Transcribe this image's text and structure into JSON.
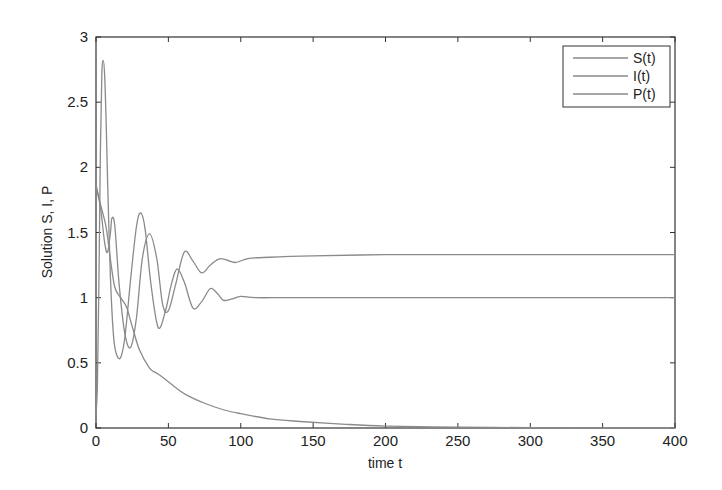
{
  "chart_data": {
    "type": "line",
    "title": "",
    "xlabel": "time t",
    "ylabel": "Solution S, I, P",
    "xlim": [
      0,
      400
    ],
    "ylim": [
      0,
      3
    ],
    "xticks": [
      0,
      50,
      100,
      150,
      200,
      250,
      300,
      350,
      400
    ],
    "yticks": [
      0,
      0.5,
      1,
      1.5,
      2,
      2.5,
      3
    ],
    "ytick_labels": [
      "0",
      "0.5",
      "1",
      "1.5",
      "2",
      "2.5",
      "3"
    ],
    "grid": false,
    "legend_position": "upper right",
    "line_color": "#8a8a8a",
    "series": [
      {
        "name": "S(t)",
        "x": [
          0,
          3,
          7,
          10,
          13,
          17,
          21,
          25,
          30,
          37,
          42,
          46,
          55,
          63,
          75,
          88,
          100,
          120,
          141,
          170,
          200,
          250,
          300,
          350,
          400
        ],
        "y": [
          1.87,
          1.72,
          1.54,
          1.29,
          1.08,
          1.0,
          0.93,
          0.78,
          0.6,
          0.46,
          0.42,
          0.39,
          0.31,
          0.25,
          0.19,
          0.14,
          0.11,
          0.07,
          0.05,
          0.03,
          0.015,
          0.006,
          0.003,
          0.001,
          0.0
        ]
      },
      {
        "name": "I(t)",
        "x": [
          0,
          1,
          2,
          3,
          4,
          5,
          6,
          7,
          8,
          10,
          12,
          14,
          17,
          20,
          24,
          28,
          31,
          34,
          38,
          43,
          48,
          52,
          56,
          61,
          67,
          73,
          79,
          84,
          88,
          94,
          100,
          110,
          130,
          160,
          200,
          250,
          300,
          350,
          400
        ],
        "y": [
          0.1,
          0.35,
          1.1,
          2.1,
          2.7,
          2.82,
          2.7,
          2.35,
          1.9,
          1.15,
          0.72,
          0.57,
          0.54,
          0.7,
          1.15,
          1.55,
          1.65,
          1.52,
          1.1,
          0.77,
          0.9,
          1.1,
          1.22,
          1.12,
          0.92,
          0.97,
          1.07,
          1.03,
          0.98,
          0.99,
          1.01,
          1.0,
          1.0,
          1.0,
          1.0,
          1.0,
          1.0,
          1.0,
          1.0
        ]
      },
      {
        "name": "P(t)",
        "x": [
          0,
          3,
          6,
          8,
          10,
          11,
          13,
          16,
          20,
          24,
          28,
          32,
          37,
          42,
          46,
          50,
          55,
          61,
          67,
          73,
          79,
          86,
          96,
          105,
          120,
          150,
          200,
          250,
          300,
          350,
          400
        ],
        "y": [
          1.85,
          1.7,
          1.42,
          1.35,
          1.5,
          1.61,
          1.55,
          1.1,
          0.72,
          0.62,
          0.85,
          1.3,
          1.49,
          1.3,
          0.95,
          0.9,
          1.1,
          1.35,
          1.28,
          1.19,
          1.25,
          1.3,
          1.27,
          1.3,
          1.31,
          1.32,
          1.33,
          1.33,
          1.33,
          1.33,
          1.33
        ]
      }
    ]
  },
  "legend": {
    "items": [
      "S(t)",
      "I(t)",
      "P(t)"
    ]
  }
}
